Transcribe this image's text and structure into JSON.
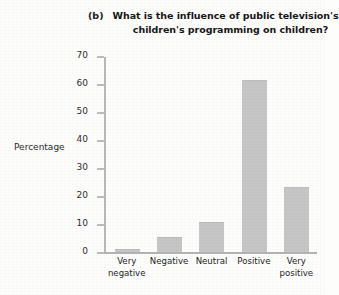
{
  "figure": {
    "panel_label": "(b)",
    "title_line_1": "What is the influence of public television's",
    "title_line_2": "children's programming on children?",
    "y_axis_title": "Percentage"
  },
  "chart_data": {
    "type": "bar",
    "title": "What is the influence of public television's children's programming on children?",
    "xlabel": "",
    "ylabel": "Percentage",
    "ylim": [
      0,
      70
    ],
    "yticks": [
      0,
      10,
      20,
      30,
      40,
      50,
      60,
      70
    ],
    "ytick_labels": [
      "0",
      "10",
      "20",
      "30",
      "40",
      "50",
      "60",
      "70"
    ],
    "grid": false,
    "legend": false,
    "bar_color": "#c6c6c6",
    "categories": [
      "Very negative",
      "Negative",
      "Neutral",
      "Positive",
      "Very positive"
    ],
    "category_lines": [
      [
        "Very",
        "negative"
      ],
      [
        "Negative",
        ""
      ],
      [
        "Neutral",
        ""
      ],
      [
        "Positive",
        ""
      ],
      [
        "Very",
        "positive"
      ]
    ],
    "values": [
      0.7,
      5,
      10.5,
      61,
      23
    ]
  }
}
